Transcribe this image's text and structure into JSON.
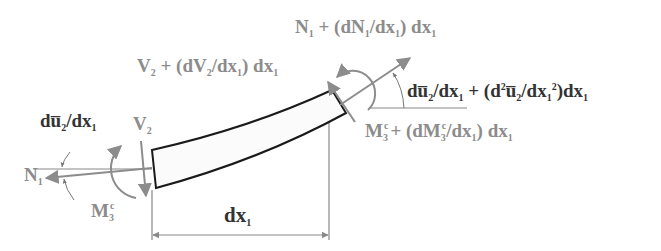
{
  "diagram": {
    "colors": {
      "beam_stroke": "#1a1a1a",
      "beam_fill": "#fbfbfb",
      "force_gray": "#8c8c8c",
      "label_gray": "#8c8c8c",
      "label_dark": "#333333",
      "dimension_line": "#888888"
    },
    "labels": {
      "n1_right": {
        "main": "N",
        "sub": "1",
        "rest": " + (dN",
        "sub2": "1",
        "rest2": "/dx",
        "sub3": "1",
        "rest3": ") dx",
        "sub4": "1"
      },
      "v2_right": {
        "main": "V",
        "sub": "2",
        "rest": " + (dV",
        "sub2": "2",
        "rest2": "/dx",
        "sub3": "1",
        "rest3": ") dx",
        "sub4": "1"
      },
      "slope_right": {
        "text": "du̅",
        "sub": "2",
        "rest": "/dx",
        "sub2": "1",
        "rest2": " + (d",
        "sup": "2",
        "rest3": "u̅",
        "sub3": "2",
        "rest4": "/dx",
        "sub4": "1",
        "sup2": "2",
        "rest5": ")dx",
        "sub5": "1"
      },
      "m3_right": {
        "main": "M",
        "sub": "3",
        "sup": "c",
        "rest": "+ (dM",
        "sub2": "3",
        "sup2": "c",
        "rest2": "/dx",
        "sub3": "1",
        "rest3": ") dx",
        "sub4": "1"
      },
      "slope_left": {
        "text": "du̅",
        "sub": "2",
        "rest": "/dx",
        "sub2": "1"
      },
      "v2_left": {
        "main": "V",
        "sub": "2"
      },
      "n1_left": {
        "main": "N",
        "sub": "1"
      },
      "m3_left": {
        "main": "M",
        "sub": "3",
        "sup": "c"
      },
      "dimension": {
        "main": "dx",
        "sub": "1"
      }
    }
  }
}
